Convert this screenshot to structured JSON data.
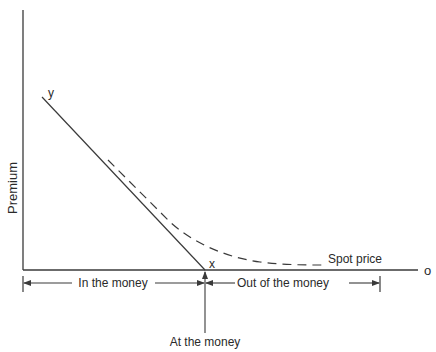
{
  "diagram": {
    "colors": {
      "ink": "#3a3a3a",
      "text": "#2a2a2a",
      "background": "#ffffff"
    },
    "axes": {
      "y_label": "Premium",
      "x_end_label": "o"
    },
    "lines": {
      "intrinsic_value": {
        "start_label": "y",
        "end_label": "x",
        "style": "solid"
      },
      "option_premium": {
        "label": "Spot price",
        "style": "dashed"
      }
    },
    "ranges": {
      "in_the_money": "In the money",
      "out_of_the_money": "Out of the money",
      "at_the_money": "At the money"
    }
  }
}
